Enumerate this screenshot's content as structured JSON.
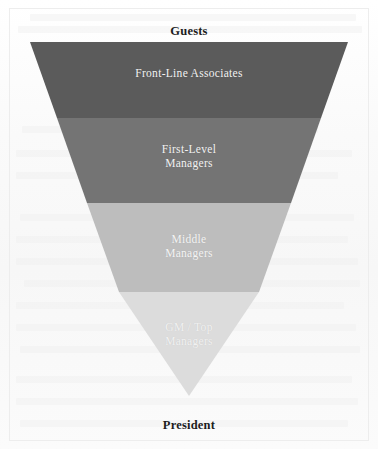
{
  "diagram": {
    "type": "inverted-pyramid-funnel",
    "top_label": "Guests",
    "bottom_label": "President",
    "levels": [
      {
        "label": "Front-Line Associates",
        "color": "#5b5b5b",
        "text_color": "#f2f2f2",
        "order": 1
      },
      {
        "label": "First-Level\nManagers",
        "color": "#747474",
        "text_color": "#f2f2f2",
        "order": 2
      },
      {
        "label": "Middle\nManagers",
        "color": "#bdbdbd",
        "text_color": "#f4f4f4",
        "order": 3
      },
      {
        "label": "GM / Top\nManagers",
        "color": "#dcdcdc",
        "text_color": "#f1f1f1",
        "order": 4
      }
    ],
    "page_background": "#fdfdfd",
    "border_color": "#ededed"
  }
}
